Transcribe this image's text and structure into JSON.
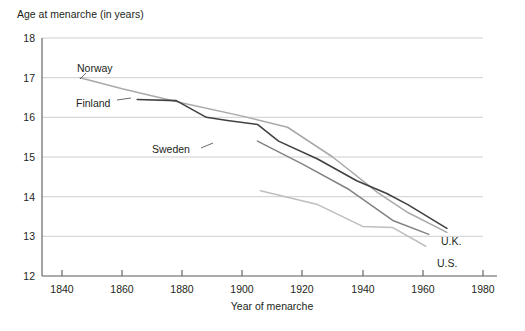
{
  "chart_data": {
    "type": "line",
    "title": "",
    "ylabel": "Age at menarche (in years)",
    "xlabel": "Year of menarche",
    "xlim": [
      1833,
      1993
    ],
    "ylim": [
      12,
      18
    ],
    "xticks": [
      1840,
      1860,
      1880,
      1900,
      1920,
      1940,
      1960,
      1980
    ],
    "xtick_labels": [
      "1840",
      "1860",
      "1880",
      "1900",
      "1920",
      "1940",
      "1960",
      "1980"
    ],
    "yticks": [
      12,
      13,
      14,
      15,
      16,
      17,
      18
    ],
    "ytick_labels": [
      "12",
      "13",
      "14",
      "15",
      "16",
      "17",
      "18"
    ],
    "grid": "horizontal",
    "legend": "inline-annotations",
    "series": [
      {
        "name": "Norway",
        "color": "#a7a9ac",
        "width": 1.5,
        "label": "Norway",
        "label_x": 88,
        "label_y": 69,
        "x": [
          1846,
          1860,
          1880,
          1900,
          1915,
          1930,
          1945,
          1955,
          1968
        ],
        "y": [
          17.0,
          16.72,
          16.36,
          16.03,
          15.75,
          15.0,
          14.1,
          13.6,
          13.1
        ]
      },
      {
        "name": "Finland",
        "color": "#414042",
        "width": 1.6,
        "label": "Finland",
        "label_x": 87,
        "label_y": 104,
        "x": [
          1865,
          1878,
          1888,
          1895,
          1905,
          1912,
          1925,
          1938,
          1948,
          1955,
          1968
        ],
        "y": [
          16.45,
          16.42,
          16.0,
          15.92,
          15.82,
          15.4,
          14.95,
          14.4,
          14.08,
          13.8,
          13.2
        ]
      },
      {
        "name": "Sweden",
        "color": "#808285",
        "width": 1.5,
        "label": "Sweden",
        "label_x": 160,
        "label_y": 151,
        "x": [
          1905,
          1920,
          1935,
          1950,
          1962
        ],
        "y": [
          15.4,
          14.82,
          14.2,
          13.4,
          13.05
        ]
      },
      {
        "name": "U.S.",
        "color": "#bcbec0",
        "width": 1.5,
        "label": "U.S.",
        "label_x": 437,
        "label_y": 264,
        "x": [
          1906,
          1925,
          1940,
          1950,
          1961
        ],
        "y": [
          14.15,
          13.8,
          13.25,
          13.22,
          12.75
        ]
      }
    ],
    "annotations": [
      {
        "text": "U.K.",
        "x": 441,
        "y": 242
      },
      {
        "text": "U.S.",
        "x": 437,
        "y": 264
      }
    ]
  },
  "labels": {
    "ylabel_title": "Age at menarche (in years)",
    "xaxis_title": "Year of menarche",
    "norway": "Norway",
    "finland": "Finland",
    "sweden": "Sweden",
    "uk": "U.K.",
    "us": "U.S.",
    "y_18": "18",
    "y_17": "17",
    "y_16": "16",
    "y_15": "15",
    "y_14": "14",
    "y_13": "13",
    "y_12": "12",
    "x_1840": "1840",
    "x_1860": "1860",
    "x_1880": "1880",
    "x_1900": "1900",
    "x_1920": "1920",
    "x_1940": "1940",
    "x_1960": "1960",
    "x_1980": "1980"
  },
  "colors": {
    "background": "#ffffff",
    "grid": "#c8c8c8",
    "axis": "#58595b",
    "text": "#231f20",
    "norway_line": "#a7a9ac",
    "finland_line": "#414042",
    "sweden_line": "#808285",
    "us_line": "#bcbec0"
  }
}
